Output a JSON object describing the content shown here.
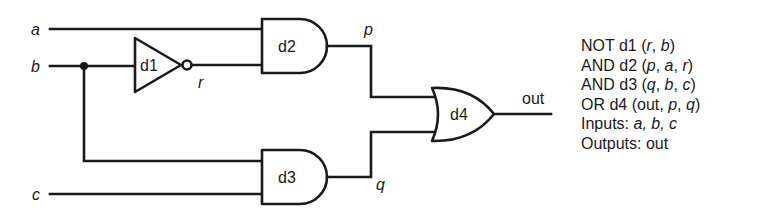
{
  "diagram": {
    "type": "logic-circuit",
    "inputs": [
      {
        "name": "a",
        "label": "a"
      },
      {
        "name": "b",
        "label": "b"
      },
      {
        "name": "c",
        "label": "c"
      }
    ],
    "outputs": [
      {
        "name": "out",
        "label": "out"
      }
    ],
    "internal_signals": [
      {
        "name": "r",
        "label": "r"
      },
      {
        "name": "p",
        "label": "p"
      },
      {
        "name": "q",
        "label": "q"
      }
    ],
    "gates": [
      {
        "id": "d1",
        "type": "NOT",
        "label": "d1",
        "output": "r",
        "inputs": [
          "b"
        ]
      },
      {
        "id": "d2",
        "type": "AND",
        "label": "d2",
        "output": "p",
        "inputs": [
          "a",
          "r"
        ]
      },
      {
        "id": "d3",
        "type": "AND",
        "label": "d3",
        "output": "q",
        "inputs": [
          "b",
          "c"
        ]
      },
      {
        "id": "d4",
        "type": "OR",
        "label": "d4",
        "output": "out",
        "inputs": [
          "p",
          "q"
        ]
      }
    ],
    "netlist": {
      "lines": [
        {
          "keyword": "NOT",
          "gate": "d1",
          "args": [
            "r",
            "b"
          ]
        },
        {
          "keyword": "AND",
          "gate": "d2",
          "args": [
            "p",
            "a",
            "r"
          ]
        },
        {
          "keyword": "AND",
          "gate": "d3",
          "args": [
            "q",
            "b",
            "c"
          ]
        },
        {
          "keyword": "OR",
          "gate": "d4",
          "args": [
            "out",
            "p",
            "q"
          ]
        }
      ],
      "inputs_label": "Inputs:",
      "inputs_values": "a, b, c",
      "outputs_label": "Outputs:",
      "outputs_values": "out"
    },
    "text": {
      "line1": "NOT d1 (r, b)",
      "line2": "AND d2 (p, a, r)",
      "line3": "AND d3 (q, b, c)",
      "line4": "OR d4 (out, p, q)",
      "line5": "Inputs: a, b, c",
      "line6": "Outputs: out"
    }
  }
}
